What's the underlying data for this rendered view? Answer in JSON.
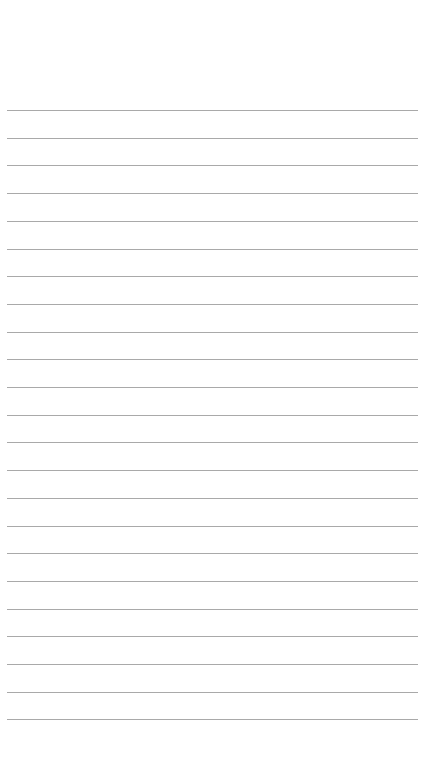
{
  "page": {
    "type": "lined-paper",
    "background": "#ffffff",
    "line_color": "#9a9a9a",
    "line_count": 23,
    "first_line_y": 110,
    "line_spacing": 27.7,
    "line_left": 7,
    "line_right": 418
  }
}
